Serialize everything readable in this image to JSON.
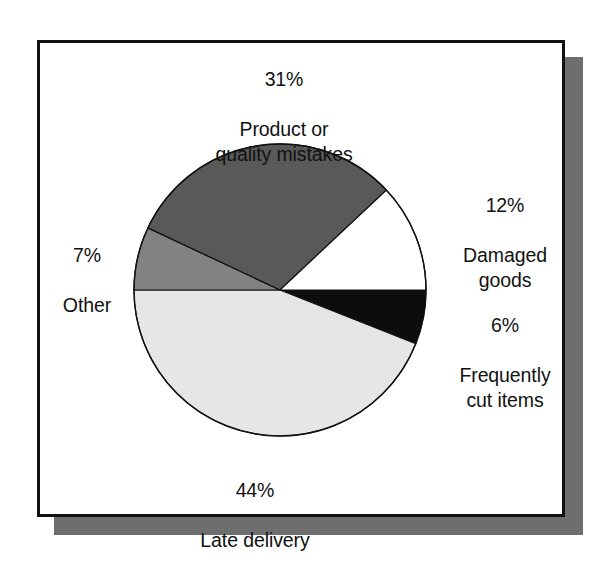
{
  "figure": {
    "frame": {
      "border_color": "#111111",
      "panel_color": "#ffffff",
      "shadow_color": "#6e6e6e"
    }
  },
  "chart_data": {
    "type": "pie",
    "title": "",
    "subtitle": "",
    "xlabel": "",
    "ylabel": "",
    "legend_position": "none",
    "grid": false,
    "units": "percent",
    "total": 100,
    "start_angle_deg": 0,
    "direction": "clockwise",
    "categories": [
      "Frequently cut items",
      "Late delivery",
      "Other",
      "Product or quality mistakes",
      "Damaged goods"
    ],
    "values": [
      6,
      44,
      7,
      31,
      12
    ],
    "slices": [
      {
        "label": "Frequently cut items",
        "label_line1": "Frequently",
        "label_line2": "cut items",
        "percent_text": "6%",
        "value": 6,
        "color": "#0d0d0d",
        "stroke": "#111111",
        "start_deg": 0,
        "end_deg": 21.6,
        "label_position": "right-lower"
      },
      {
        "label": "Late delivery",
        "label_line1": "Late delivery",
        "label_line2": "",
        "percent_text": "44%",
        "value": 44,
        "color": "#e6e6e6",
        "stroke": "#111111",
        "start_deg": 21.6,
        "end_deg": 180.0,
        "label_position": "bottom"
      },
      {
        "label": "Other",
        "label_line1": "Other",
        "label_line2": "",
        "percent_text": "7%",
        "value": 7,
        "color": "#828282",
        "stroke": "#111111",
        "start_deg": 180.0,
        "end_deg": 205.2,
        "label_position": "left"
      },
      {
        "label": "Product or quality mistakes",
        "label_line1": "Product or",
        "label_line2": "quality mistakes",
        "percent_text": "31%",
        "value": 31,
        "color": "#595959",
        "stroke": "#111111",
        "start_deg": 205.2,
        "end_deg": 316.8,
        "label_position": "top"
      },
      {
        "label": "Damaged goods",
        "label_line1": "Damaged",
        "label_line2": "goods",
        "percent_text": "12%",
        "value": 12,
        "color": "#ffffff",
        "stroke": "#111111",
        "start_deg": 316.8,
        "end_deg": 360.0,
        "label_position": "right-upper"
      }
    ]
  },
  "labels": {
    "top": {
      "percent": "31%",
      "name": "Product or\nquality mistakes"
    },
    "right_upper": {
      "percent": "12%",
      "name": "Damaged\ngoods"
    },
    "right_lower": {
      "percent": "6%",
      "name": "Frequently\ncut items"
    },
    "left": {
      "percent": "7%",
      "name": "Other"
    },
    "bottom": {
      "percent": "44%",
      "name": "Late delivery"
    }
  }
}
